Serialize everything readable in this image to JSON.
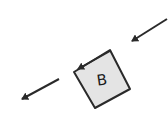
{
  "diagram": {
    "block": {
      "label": "B",
      "fill": "#e4e4e4",
      "stroke": "#2a2a2a",
      "corners": [
        [
          110,
          50
        ],
        [
          130,
          89
        ],
        [
          95,
          108
        ],
        [
          74,
          72
        ]
      ]
    },
    "arrows": [
      {
        "name": "incoming-arrow",
        "from": [
          167,
          19
        ],
        "to": [
          130,
          42
        ]
      },
      {
        "name": "edge-arrow",
        "from": [
          110,
          51
        ],
        "to": [
          76,
          70
        ]
      },
      {
        "name": "outgoing-arrow",
        "from": [
          59,
          79
        ],
        "to": [
          20,
          100
        ]
      }
    ],
    "stroke_color": "#2a2a2a"
  }
}
